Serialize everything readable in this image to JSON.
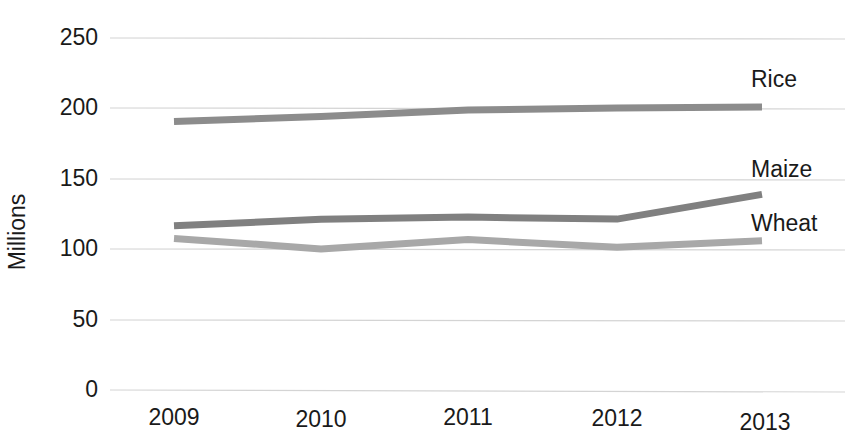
{
  "chart_data": {
    "type": "line",
    "title": "",
    "subtitle": "",
    "xlabel": "",
    "ylabel": "Millions",
    "categories": [
      "2009",
      "2010",
      "2011",
      "2012",
      "2013"
    ],
    "x": [
      2009,
      2010,
      2011,
      2012,
      2013
    ],
    "series": [
      {
        "name": "Rice",
        "values": [
          191,
          195,
          200,
          202,
          203
        ],
        "color": "#8c8c8c"
      },
      {
        "name": "Maize",
        "values": [
          117,
          122,
          124,
          123,
          141
        ],
        "color": "#808080"
      },
      {
        "name": "Wheat",
        "values": [
          108,
          101,
          108,
          103,
          108
        ],
        "color": "#a8a8a8"
      }
    ],
    "ylim": [
      0,
      250
    ],
    "yticks": [
      0,
      50,
      100,
      150,
      200,
      250
    ],
    "ytick_labels": [
      "0",
      "50",
      "100",
      "150",
      "200",
      "250"
    ],
    "grid": "horizontal",
    "legend": "inline-right-of-series",
    "axis_line": "none"
  },
  "labels": {
    "y_axis_title": "Millions",
    "ytick_0": "0",
    "ytick_50": "50",
    "ytick_100": "100",
    "ytick_150": "150",
    "ytick_200": "200",
    "ytick_250": "250",
    "xtick_2009": "2009",
    "xtick_2010": "2010",
    "xtick_2011": "2011",
    "xtick_2012": "2012",
    "xtick_2013": "2013",
    "series_rice": "Rice",
    "series_maize": "Maize",
    "series_wheat": "Wheat"
  }
}
